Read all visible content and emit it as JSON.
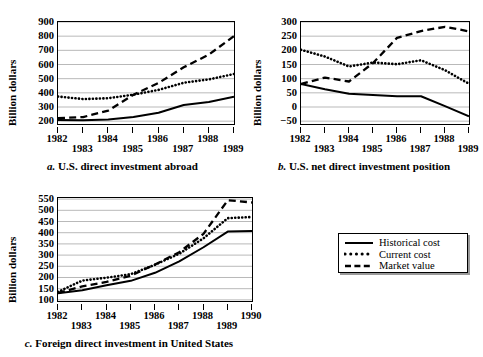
{
  "figure": {
    "ylabel": "Billion dollars",
    "legend": {
      "name": "chart-legend",
      "items": [
        {
          "label": "Historical cost",
          "style": "solid",
          "icon": "solid-line-icon"
        },
        {
          "label": "Current cost",
          "style": "dotted",
          "icon": "dotted-line-icon"
        },
        {
          "label": "Market value",
          "style": "dashed",
          "icon": "dashed-line-icon"
        }
      ]
    }
  },
  "chart_data": [
    {
      "id": "a",
      "type": "line",
      "title": "U.S. direct investment abroad",
      "caption_label": "a.",
      "caption_text": "U.S. direct investment abroad",
      "xlabel": "",
      "ylabel": "Billion dollars",
      "grid": true,
      "legend_position": "external",
      "x": [
        1982,
        1983,
        1984,
        1985,
        1986,
        1987,
        1988,
        1989
      ],
      "xlim": [
        1982,
        1989
      ],
      "xticks": [
        1982,
        1983,
        1984,
        1985,
        1986,
        1987,
        1988,
        1989
      ],
      "ylim": [
        180,
        900
      ],
      "yticks": [
        200,
        300,
        400,
        500,
        600,
        700,
        800,
        900
      ],
      "series": [
        {
          "name": "Historical cost",
          "style": "solid",
          "values": [
            208,
            207,
            212,
            230,
            260,
            314,
            335,
            373
          ]
        },
        {
          "name": "Current cost",
          "style": "dotted",
          "values": [
            374,
            356,
            362,
            387,
            421,
            471,
            495,
            533
          ]
        },
        {
          "name": "Market value",
          "style": "dashed",
          "values": [
            221,
            229,
            275,
            386,
            470,
            580,
            670,
            800
          ]
        }
      ]
    },
    {
      "id": "b",
      "type": "line",
      "title": "U.S. net direct investment position",
      "caption_label": "b.",
      "caption_text": "U.S. net direct investment position",
      "xlabel": "",
      "ylabel": "Billion dollars",
      "grid": true,
      "legend_position": "external",
      "x": [
        1982,
        1983,
        1984,
        1985,
        1986,
        1987,
        1988,
        1989
      ],
      "xlim": [
        1982,
        1989
      ],
      "xticks": [
        1982,
        1983,
        1984,
        1985,
        1986,
        1987,
        1988,
        1989
      ],
      "ylim": [
        -60,
        300
      ],
      "yticks": [
        -50,
        0,
        50,
        100,
        150,
        200,
        250,
        300
      ],
      "series": [
        {
          "name": "Historical cost",
          "style": "solid",
          "values": [
            81,
            63,
            47,
            42,
            38,
            38,
            3,
            -33
          ]
        },
        {
          "name": "Current cost",
          "style": "dotted",
          "values": [
            202,
            178,
            143,
            157,
            151,
            165,
            130,
            82
          ]
        },
        {
          "name": "Market value",
          "style": "dashed",
          "values": [
            81,
            104,
            90,
            155,
            244,
            268,
            283,
            267
          ]
        }
      ]
    },
    {
      "id": "c",
      "type": "line",
      "title": "Foreign direct investment in United States",
      "caption_label": "c.",
      "caption_text": "Foreign direct investment in United States",
      "xlabel": "",
      "ylabel": "Billion dollars",
      "grid": true,
      "legend_position": "external",
      "x": [
        1982,
        1983,
        1984,
        1985,
        1986,
        1987,
        1988,
        1989,
        1990
      ],
      "xlim": [
        1982,
        1990
      ],
      "xticks": [
        1982,
        1983,
        1984,
        1985,
        1986,
        1987,
        1988,
        1989,
        1990
      ],
      "ylim": [
        95,
        555
      ],
      "yticks": [
        100,
        150,
        200,
        250,
        300,
        350,
        400,
        450,
        500,
        550
      ],
      "series": [
        {
          "name": "Historical cost",
          "style": "solid",
          "values": [
            130,
            143,
            165,
            185,
            221,
            272,
            335,
            405,
            408
          ]
        },
        {
          "name": "Current cost",
          "style": "dotted",
          "values": [
            136,
            186,
            199,
            215,
            257,
            306,
            375,
            465,
            470
          ]
        },
        {
          "name": "Market value",
          "style": "dashed",
          "values": [
            131,
            160,
            180,
            208,
            258,
            313,
            395,
            545,
            535
          ]
        }
      ]
    }
  ]
}
